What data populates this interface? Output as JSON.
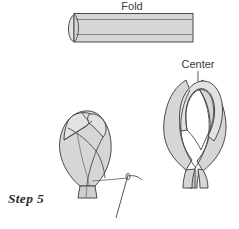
{
  "diagram": {
    "step_label": "Step 5",
    "background_color": "#ffffff",
    "ribbon_fill_color": "#d6d6d6",
    "ribbon_outline_color": "#4a4a4a",
    "label_text_color": "#3a3a3a",
    "labels": {
      "fold": "Fold",
      "center": "Center"
    },
    "figures": [
      {
        "name": "folded-ribbon-strip",
        "label": "Fold",
        "description": "Horizontal folded ribbon strip with rounded fold at left end"
      },
      {
        "name": "gathered-bud",
        "label": "",
        "description": "Gathered rosebud shape with needle and thread at base"
      },
      {
        "name": "ribbon-loop",
        "label": "Center",
        "description": "Looped ribbon with crossed tails marking the center point"
      }
    ]
  }
}
